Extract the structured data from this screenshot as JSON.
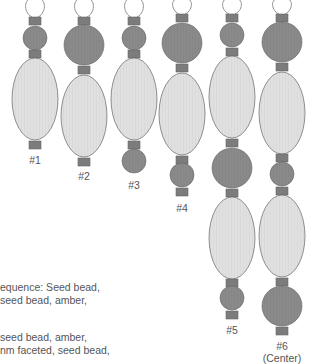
{
  "diagram": {
    "colors": {
      "large_bead_fill": "#e0e0e0",
      "round_bead_fill": "#8a8a8a",
      "seed_bead_fill": "#7c7c7c",
      "outline": "#666666",
      "wire": "#888888",
      "label_text": "#555555"
    },
    "strands": [
      {
        "label": "#1",
        "sublabel": "",
        "cx": 35,
        "sequence": [
          {
            "type": "seed",
            "y": 17
          },
          {
            "type": "round-small",
            "y": 38
          },
          {
            "type": "seed",
            "y": 50
          },
          {
            "type": "oval",
            "y": 99
          },
          {
            "type": "seed",
            "y": 141
          }
        ],
        "label_y": 154
      },
      {
        "label": "#2",
        "sublabel": "",
        "cx": 84,
        "sequence": [
          {
            "type": "seed",
            "y": 17
          },
          {
            "type": "round-large",
            "y": 45
          },
          {
            "type": "seed",
            "y": 66
          },
          {
            "type": "oval",
            "y": 116
          },
          {
            "type": "seed",
            "y": 158
          }
        ],
        "label_y": 170
      },
      {
        "label": "#3",
        "sublabel": "",
        "cx": 134,
        "sequence": [
          {
            "type": "seed",
            "y": 17
          },
          {
            "type": "round-small",
            "y": 38
          },
          {
            "type": "seed",
            "y": 50
          },
          {
            "type": "oval",
            "y": 99
          },
          {
            "type": "seed",
            "y": 141
          },
          {
            "type": "round-small",
            "y": 161
          }
        ],
        "label_y": 179
      },
      {
        "label": "#4",
        "sublabel": "",
        "cx": 182,
        "sequence": [
          {
            "type": "seed",
            "y": 14
          },
          {
            "type": "round-large",
            "y": 43
          },
          {
            "type": "seed",
            "y": 64
          },
          {
            "type": "oval",
            "y": 114
          },
          {
            "type": "seed",
            "y": 156
          },
          {
            "type": "round-small",
            "y": 175
          },
          {
            "type": "seed",
            "y": 188
          }
        ],
        "label_y": 202
      },
      {
        "label": "#5",
        "sublabel": "",
        "cx": 232,
        "sequence": [
          {
            "type": "seed",
            "y": 14
          },
          {
            "type": "round-small",
            "y": 35
          },
          {
            "type": "seed",
            "y": 48
          },
          {
            "type": "oval",
            "y": 97
          },
          {
            "type": "seed",
            "y": 139
          },
          {
            "type": "round-large",
            "y": 168
          },
          {
            "type": "seed",
            "y": 189
          },
          {
            "type": "oval",
            "y": 238
          },
          {
            "type": "seed",
            "y": 279
          },
          {
            "type": "round-small",
            "y": 298
          },
          {
            "type": "seed",
            "y": 311
          }
        ],
        "label_y": 324
      },
      {
        "label": "#6",
        "sublabel": "(Center)",
        "cx": 282,
        "sequence": [
          {
            "type": "seed",
            "y": 14
          },
          {
            "type": "round-large",
            "y": 42
          },
          {
            "type": "seed",
            "y": 63
          },
          {
            "type": "oval",
            "y": 113
          },
          {
            "type": "seed",
            "y": 154
          },
          {
            "type": "round-small",
            "y": 174
          },
          {
            "type": "seed",
            "y": 187
          },
          {
            "type": "oval",
            "y": 236
          },
          {
            "type": "seed",
            "y": 278
          },
          {
            "type": "round-large",
            "y": 306
          },
          {
            "type": "seed",
            "y": 327
          }
        ],
        "label_y": 340
      }
    ],
    "caption_lines": [
      {
        "text": "equence: Seed bead,",
        "y": 281
      },
      {
        "text": " seed bead, amber,",
        "y": 294
      },
      {
        "text": "seed bead, amber,",
        "y": 331
      },
      {
        "text": "nm faceted, seed bead,",
        "y": 344
      }
    ]
  }
}
